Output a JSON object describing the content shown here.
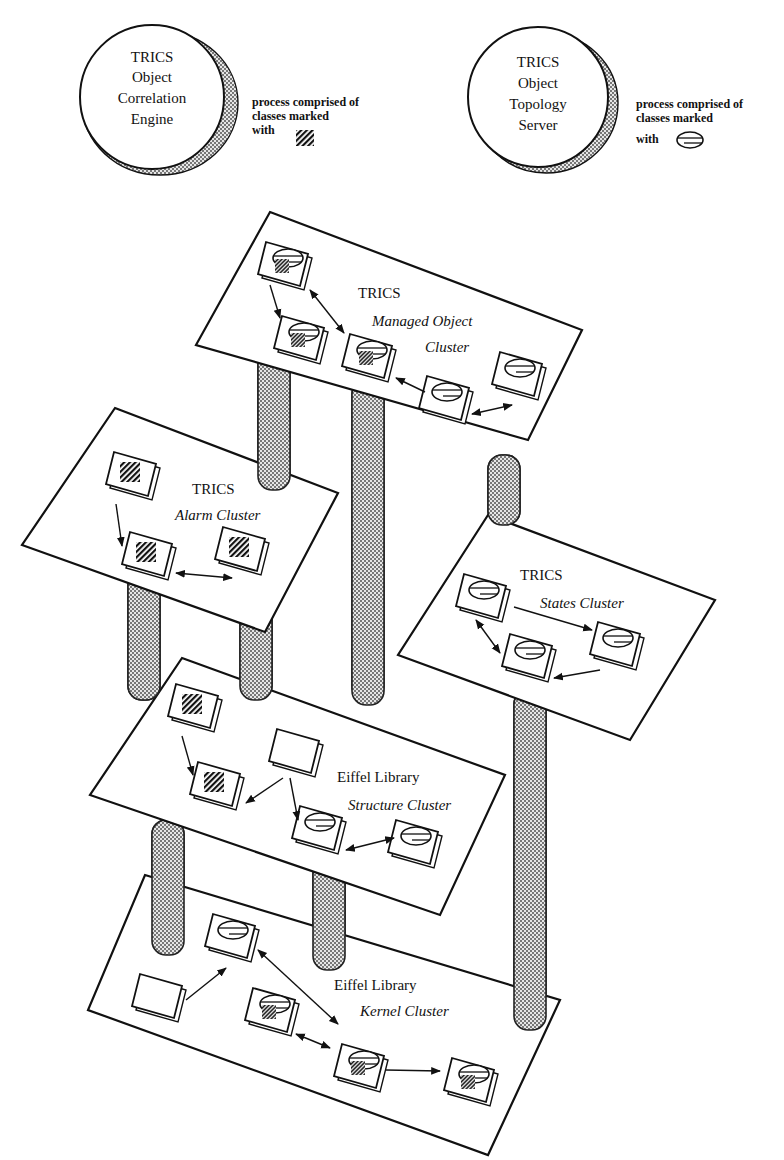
{
  "processes": [
    {
      "id": "correlation-engine",
      "lines": [
        "TRICS",
        "Object",
        "Correlation",
        "Engine"
      ],
      "legend": [
        "process comprised of",
        "classes marked",
        "with"
      ],
      "marker": "hatched-square"
    },
    {
      "id": "topology-server",
      "lines": [
        "TRICS",
        "Object",
        "Topology",
        "Server"
      ],
      "legend": [
        "process comprised of",
        "classes marked",
        "with"
      ],
      "marker": "striped-ellipse"
    }
  ],
  "clusters": [
    {
      "id": "managed-object",
      "title": "TRICS",
      "subtitle_1": "Managed Object",
      "subtitle_2": "Cluster"
    },
    {
      "id": "alarm",
      "title": "TRICS",
      "subtitle_1": "Alarm Cluster"
    },
    {
      "id": "states",
      "title": "TRICS",
      "subtitle_1": "States Cluster"
    },
    {
      "id": "structure",
      "title": "Eiffel Library",
      "subtitle_1": "Structure Cluster"
    },
    {
      "id": "kernel",
      "title": "Eiffel Library",
      "subtitle_1": "Kernel Cluster"
    }
  ],
  "colors": {
    "ink": "#111111",
    "background": "#ffffff",
    "pillar_fill": "#bdbdbd"
  }
}
